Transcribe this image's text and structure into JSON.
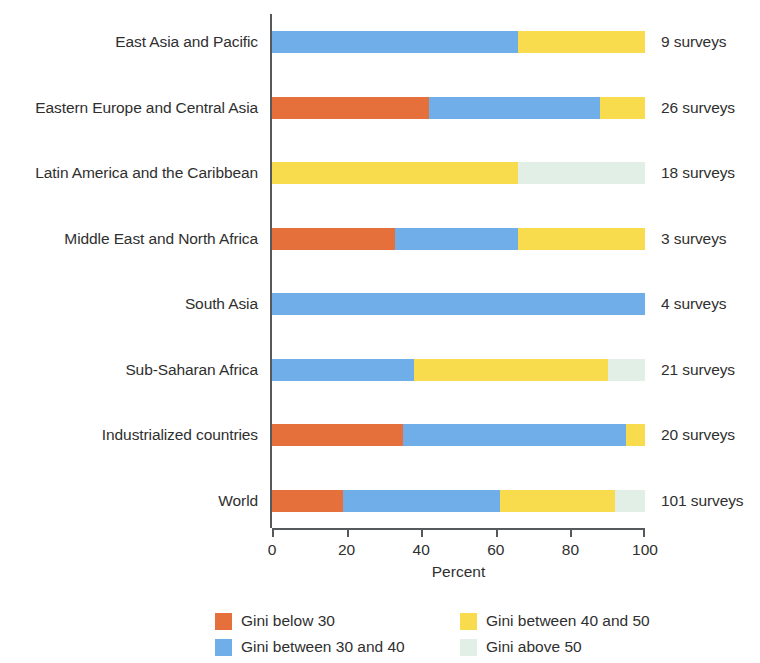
{
  "chart_data": {
    "type": "bar",
    "orientation": "horizontal",
    "stacked": true,
    "stack_total": 100,
    "title": "",
    "xlabel": "Percent",
    "ylabel": "",
    "xlim": [
      0,
      100
    ],
    "xticks": [
      "0",
      "20",
      "40",
      "60",
      "80",
      "100"
    ],
    "xtick_values": [
      0,
      20,
      40,
      60,
      80,
      100
    ],
    "grid": false,
    "legend_position": "bottom",
    "categories": [
      "East Asia and Pacific",
      "Eastern Europe and Central Asia",
      "Latin America and the Caribbean",
      "Middle East and North Africa",
      "South Asia",
      "Sub-Saharan Africa",
      "Industrialized countries",
      "World"
    ],
    "series": [
      {
        "name": "Gini below 30",
        "color": "#E5703B",
        "values": [
          0,
          42,
          0,
          33,
          0,
          0,
          35,
          19
        ]
      },
      {
        "name": "Gini between 30 and 40",
        "color": "#6FAEE8",
        "values": [
          66,
          46,
          0,
          33,
          100,
          38,
          60,
          42
        ]
      },
      {
        "name": "Gini between 40 and 50",
        "color": "#F8DC4E",
        "values": [
          34,
          12,
          66,
          34,
          0,
          52,
          5,
          31
        ]
      },
      {
        "name": "Gini above 50",
        "color": "#E2EFE6",
        "values": [
          0,
          0,
          34,
          0,
          0,
          10,
          0,
          8
        ]
      }
    ],
    "annotations": [
      "9 surveys",
      "26 surveys",
      "18 surveys",
      "3 surveys",
      "4 surveys",
      "21 surveys",
      "20 surveys",
      "101 surveys"
    ]
  },
  "legend": {
    "items": [
      {
        "label": "Gini below 30",
        "color": "#E5703B"
      },
      {
        "label": "Gini between 40 and 50",
        "color": "#F8DC4E"
      },
      {
        "label": "Gini between 30 and 40",
        "color": "#6FAEE8"
      },
      {
        "label": "Gini above 50",
        "color": "#E2EFE6"
      }
    ]
  }
}
